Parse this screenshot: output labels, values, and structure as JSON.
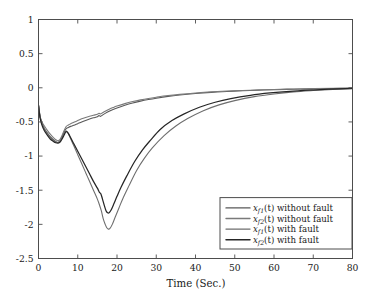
{
  "figure": {
    "background_color": "#ffffff",
    "axes_color": "#4d4d4d"
  },
  "chart_data": {
    "type": "line",
    "title": "",
    "xlabel": "Time (Sec.)",
    "ylabel": "",
    "xlim": [
      0,
      80
    ],
    "ylim": [
      -2.5,
      1
    ],
    "xticks": [
      0,
      10,
      20,
      30,
      40,
      50,
      60,
      70,
      80
    ],
    "yticks": [
      1,
      0.5,
      0,
      -0.5,
      -1,
      -1.5,
      -2,
      -2.5
    ],
    "xtick_labels": [
      "0",
      "10",
      "20",
      "30",
      "40",
      "50",
      "60",
      "70",
      "80"
    ],
    "ytick_labels": [
      "1",
      "0.5",
      "0",
      "-0.5",
      "-1",
      "-1.5",
      "-2",
      "-2.5"
    ],
    "grid": false,
    "legend_position": "lower right",
    "series": [
      {
        "name": "x_{f1}(t) without fault",
        "label_base": "x",
        "label_sub": "f1",
        "label_arg": "(t)",
        "label_rest": " without fault",
        "color": "#595959",
        "width": 1.1,
        "x": [
          0,
          0.4,
          0.9,
          1.5,
          2.2,
          3,
          3.8,
          4.4,
          5,
          5.5,
          6,
          6.5,
          7,
          7.6,
          8.2,
          9,
          10,
          11,
          12,
          13,
          14,
          15,
          15.4,
          15.8,
          16.3,
          17,
          18,
          19,
          20,
          22,
          24,
          26,
          28,
          30,
          33,
          36,
          40,
          44,
          48,
          52,
          56,
          60,
          65,
          70,
          75,
          80
        ],
        "y": [
          -0.25,
          -0.42,
          -0.52,
          -0.6,
          -0.66,
          -0.72,
          -0.76,
          -0.79,
          -0.8,
          -0.78,
          -0.72,
          -0.65,
          -0.6,
          -0.58,
          -0.565,
          -0.55,
          -0.525,
          -0.5,
          -0.478,
          -0.458,
          -0.44,
          -0.425,
          -0.405,
          -0.418,
          -0.4,
          -0.375,
          -0.345,
          -0.318,
          -0.295,
          -0.255,
          -0.222,
          -0.195,
          -0.172,
          -0.152,
          -0.126,
          -0.106,
          -0.084,
          -0.067,
          -0.054,
          -0.044,
          -0.035,
          -0.028,
          -0.021,
          -0.015,
          -0.01,
          -0.006
        ]
      },
      {
        "name": "x_{f2}(t) without fault",
        "label_base": "x",
        "label_sub": "f2",
        "label_arg": "(t)",
        "label_rest": " without fault",
        "color": "#7a7a7a",
        "width": 1.1,
        "x": [
          0,
          0.4,
          0.9,
          1.5,
          2.2,
          3,
          3.8,
          4.4,
          5,
          5.5,
          6,
          6.5,
          7,
          7.6,
          8.2,
          9,
          10,
          11,
          12,
          13,
          14,
          15,
          15.4,
          15.8,
          16.3,
          17,
          18,
          19,
          20,
          22,
          24,
          26,
          28,
          30,
          33,
          36,
          40,
          44,
          48,
          52,
          56,
          60,
          65,
          70,
          75,
          80
        ],
        "y": [
          -0.26,
          -0.43,
          -0.5,
          -0.56,
          -0.62,
          -0.68,
          -0.73,
          -0.76,
          -0.775,
          -0.755,
          -0.7,
          -0.63,
          -0.57,
          -0.545,
          -0.525,
          -0.505,
          -0.48,
          -0.455,
          -0.435,
          -0.418,
          -0.402,
          -0.388,
          -0.372,
          -0.383,
          -0.366,
          -0.343,
          -0.315,
          -0.29,
          -0.268,
          -0.232,
          -0.202,
          -0.177,
          -0.156,
          -0.138,
          -0.114,
          -0.096,
          -0.076,
          -0.06,
          -0.048,
          -0.039,
          -0.031,
          -0.025,
          -0.018,
          -0.013,
          -0.009,
          -0.005
        ]
      },
      {
        "name": "x_{f1}(t) with fault",
        "label_base": "x",
        "label_sub": "f1",
        "label_arg": "(t)",
        "label_rest": " with fault",
        "color": "#6e6e6e",
        "width": 1.1,
        "x": [
          0,
          0.4,
          0.9,
          1.5,
          2.2,
          3,
          3.8,
          4.4,
          5,
          5.5,
          6,
          6.5,
          7,
          7.5,
          8,
          9,
          10,
          11,
          12,
          13,
          14,
          15,
          15.5,
          16,
          16.5,
          17,
          17.4,
          17.8,
          18.2,
          18.8,
          19.5,
          20.5,
          21.5,
          23,
          25,
          27,
          29,
          32,
          35,
          38,
          42,
          46,
          50,
          55,
          60,
          65,
          70,
          75,
          80
        ],
        "y": [
          -0.25,
          -0.42,
          -0.52,
          -0.6,
          -0.66,
          -0.72,
          -0.765,
          -0.79,
          -0.8,
          -0.78,
          -0.73,
          -0.675,
          -0.63,
          -0.66,
          -0.72,
          -0.85,
          -0.98,
          -1.11,
          -1.24,
          -1.37,
          -1.5,
          -1.63,
          -1.71,
          -1.8,
          -1.92,
          -2.0,
          -2.05,
          -2.07,
          -2.06,
          -2.0,
          -1.9,
          -1.76,
          -1.62,
          -1.44,
          -1.21,
          -1.03,
          -0.88,
          -0.7,
          -0.56,
          -0.45,
          -0.335,
          -0.25,
          -0.188,
          -0.13,
          -0.09,
          -0.06,
          -0.04,
          -0.024,
          -0.012
        ]
      },
      {
        "name": "x_{f2}(t) with fault",
        "label_base": "x",
        "label_sub": "f2",
        "label_arg": "(t)",
        "label_rest": " with fault",
        "color": "#262626",
        "width": 1.25,
        "x": [
          0,
          0.4,
          0.9,
          1.5,
          2.2,
          3,
          3.8,
          4.4,
          5,
          5.5,
          6,
          6.5,
          7,
          7.5,
          8,
          9,
          10,
          11,
          12,
          13,
          14,
          15,
          15.5,
          15.9,
          16.3,
          16.8,
          17.2,
          17.6,
          18,
          18.5,
          19.2,
          20,
          21,
          22.5,
          24.5,
          26.5,
          28.5,
          31,
          34,
          37,
          41,
          45,
          49,
          54,
          59,
          64,
          69,
          74,
          80
        ],
        "y": [
          -0.26,
          -0.44,
          -0.55,
          -0.63,
          -0.69,
          -0.75,
          -0.785,
          -0.805,
          -0.81,
          -0.795,
          -0.75,
          -0.695,
          -0.645,
          -0.66,
          -0.71,
          -0.82,
          -0.93,
          -1.04,
          -1.15,
          -1.26,
          -1.37,
          -1.47,
          -1.53,
          -1.555,
          -1.63,
          -1.73,
          -1.8,
          -1.83,
          -1.83,
          -1.79,
          -1.7,
          -1.59,
          -1.46,
          -1.29,
          -1.08,
          -0.91,
          -0.77,
          -0.61,
          -0.48,
          -0.385,
          -0.285,
          -0.212,
          -0.158,
          -0.11,
          -0.076,
          -0.051,
          -0.034,
          -0.021,
          -0.01
        ]
      }
    ]
  }
}
